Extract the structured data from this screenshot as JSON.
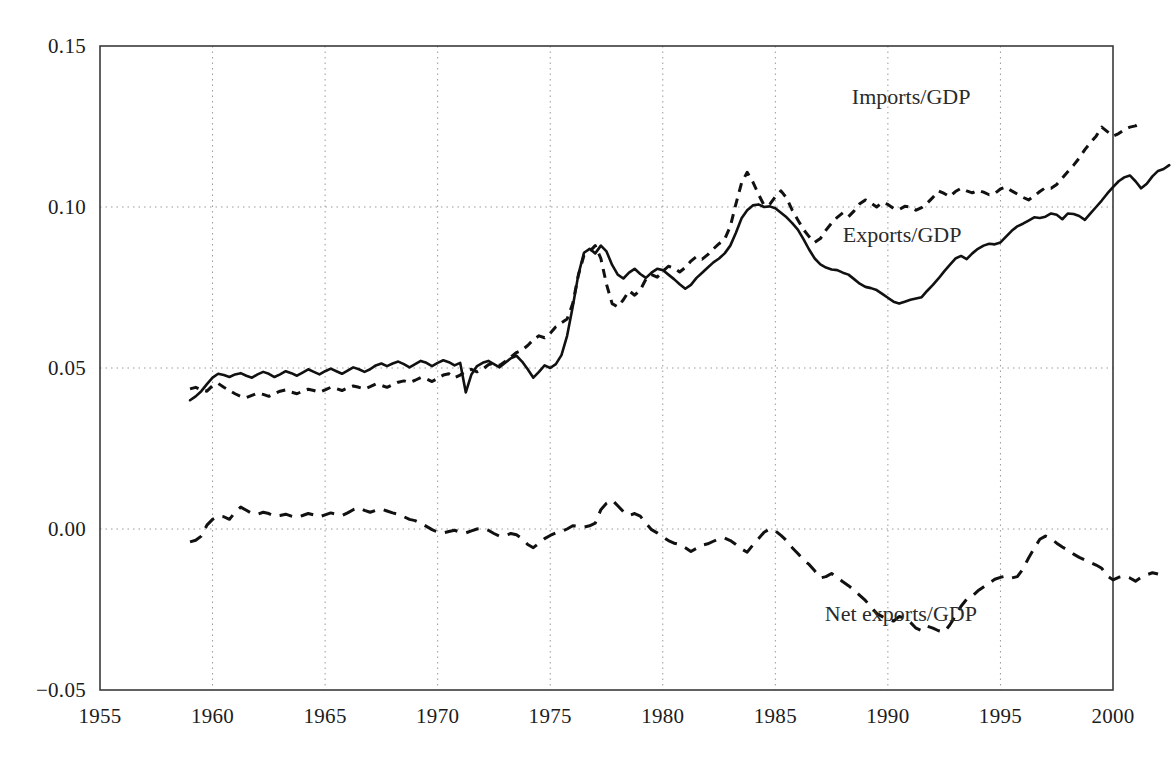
{
  "chart_data": {
    "type": "line",
    "title": "",
    "subtitle": "",
    "xlabel": "",
    "ylabel": "",
    "xlim": [
      1955,
      2000
    ],
    "ylim": [
      -0.05,
      0.15
    ],
    "grid": true,
    "grid_style": "dotted",
    "legend_position": "inline-annotations",
    "x_ticks": [
      "1955",
      "1960",
      "1965",
      "1970",
      "1975",
      "1980",
      "1985",
      "1990",
      "1995",
      "2000"
    ],
    "x_tick_values": [
      1955,
      1960,
      1965,
      1970,
      1975,
      1980,
      1985,
      1990,
      1995,
      2000
    ],
    "y_ticks": [
      "-0.05",
      "0.00",
      "0.05",
      "0.10",
      "0.15"
    ],
    "y_tick_values": [
      -0.05,
      0.0,
      0.05,
      0.1,
      0.15
    ],
    "x_start": 1959.0,
    "x_end": 1996.75,
    "x_step": 0.25,
    "series": [
      {
        "name": "Imports/GDP",
        "style": "dotted",
        "color": "#111111",
        "label_x": 1988.4,
        "label_y": 0.134,
        "values": [
          0.0435,
          0.044,
          0.0432,
          0.0428,
          0.0445,
          0.0452,
          0.044,
          0.043,
          0.042,
          0.0412,
          0.0408,
          0.0415,
          0.0422,
          0.0418,
          0.0412,
          0.042,
          0.0428,
          0.0432,
          0.0425,
          0.042,
          0.0428,
          0.0434,
          0.043,
          0.0425,
          0.0432,
          0.044,
          0.0436,
          0.043,
          0.0438,
          0.0444,
          0.044,
          0.0435,
          0.0442,
          0.045,
          0.0446,
          0.044,
          0.0448,
          0.0456,
          0.046,
          0.0455,
          0.0462,
          0.047,
          0.0466,
          0.0458,
          0.0468,
          0.0478,
          0.0482,
          0.047,
          0.0478,
          0.049,
          0.0496,
          0.0488,
          0.0496,
          0.051,
          0.0516,
          0.0508,
          0.052,
          0.0534,
          0.0548,
          0.0556,
          0.057,
          0.0588,
          0.06,
          0.0594,
          0.0608,
          0.0628,
          0.064,
          0.0652,
          0.07,
          0.0788,
          0.085,
          0.0862,
          0.088,
          0.084,
          0.076,
          0.07,
          0.069,
          0.0712,
          0.074,
          0.0726,
          0.0742,
          0.0776,
          0.079,
          0.0782,
          0.08,
          0.0816,
          0.081,
          0.0798,
          0.0812,
          0.0832,
          0.0846,
          0.0838,
          0.0852,
          0.087,
          0.0886,
          0.09,
          0.094,
          0.101,
          0.1075,
          0.1108,
          0.1078,
          0.104,
          0.1005,
          0.1008,
          0.1032,
          0.105,
          0.1028,
          0.099,
          0.096,
          0.093,
          0.0908,
          0.089,
          0.0902,
          0.0928,
          0.095,
          0.0968,
          0.0982,
          0.097,
          0.0988,
          0.101,
          0.1022,
          0.1012,
          0.1,
          0.1014,
          0.1008,
          0.0996,
          0.0992,
          0.1002,
          0.1,
          0.099,
          0.0998,
          0.1012,
          0.103,
          0.105,
          0.1042,
          0.1032,
          0.1048,
          0.1058,
          0.105,
          0.1044,
          0.1052,
          0.1046,
          0.1038,
          0.1042,
          0.1056,
          0.1062,
          0.105,
          0.104,
          0.103,
          0.1022,
          0.1034,
          0.1048,
          0.106,
          0.1058,
          0.107,
          0.109,
          0.111,
          0.113,
          0.1152,
          0.1178,
          0.12,
          0.122,
          0.1248,
          0.1234,
          0.122,
          0.1228,
          0.124,
          0.1248,
          0.1252,
          0.1262
        ]
      },
      {
        "name": "Exports/GDP",
        "style": "solid",
        "color": "#111111",
        "label_x": 1988.0,
        "label_y": 0.091,
        "values": [
          0.04,
          0.0412,
          0.0428,
          0.045,
          0.047,
          0.0482,
          0.0478,
          0.0472,
          0.048,
          0.0484,
          0.0476,
          0.047,
          0.048,
          0.0488,
          0.0482,
          0.0472,
          0.048,
          0.049,
          0.0484,
          0.0476,
          0.0486,
          0.0496,
          0.0488,
          0.048,
          0.049,
          0.0498,
          0.049,
          0.0482,
          0.0492,
          0.0502,
          0.0496,
          0.0488,
          0.0496,
          0.0508,
          0.0514,
          0.0506,
          0.0514,
          0.052,
          0.0512,
          0.0502,
          0.0512,
          0.0522,
          0.0516,
          0.0506,
          0.0516,
          0.0524,
          0.0518,
          0.0508,
          0.0516,
          0.0424,
          0.048,
          0.0506,
          0.0516,
          0.0522,
          0.0512,
          0.0502,
          0.0516,
          0.053,
          0.0538,
          0.052,
          0.0496,
          0.047,
          0.0488,
          0.0508,
          0.05,
          0.0512,
          0.054,
          0.06,
          0.069,
          0.079,
          0.0858,
          0.087,
          0.0856,
          0.088,
          0.0862,
          0.082,
          0.079,
          0.0778,
          0.0796,
          0.0808,
          0.0792,
          0.078,
          0.0796,
          0.0808,
          0.0804,
          0.079,
          0.0776,
          0.076,
          0.0746,
          0.0758,
          0.078,
          0.0796,
          0.0812,
          0.0828,
          0.084,
          0.0856,
          0.088,
          0.092,
          0.0965,
          0.099,
          0.1005,
          0.1008,
          0.1,
          0.1002,
          0.0996,
          0.0982,
          0.0968,
          0.095,
          0.093,
          0.09,
          0.0868,
          0.084,
          0.0822,
          0.0812,
          0.0806,
          0.0804,
          0.0796,
          0.079,
          0.0776,
          0.0762,
          0.0752,
          0.0748,
          0.0742,
          0.073,
          0.0718,
          0.0706,
          0.07,
          0.0706,
          0.0712,
          0.0716,
          0.072,
          0.074,
          0.0758,
          0.0778,
          0.08,
          0.082,
          0.084,
          0.0848,
          0.0838,
          0.0856,
          0.087,
          0.088,
          0.0886,
          0.0884,
          0.089,
          0.0908,
          0.0926,
          0.094,
          0.0948,
          0.0958,
          0.0968,
          0.0966,
          0.097,
          0.098,
          0.0976,
          0.0962,
          0.098,
          0.0978,
          0.0972,
          0.096,
          0.098,
          0.1,
          0.102,
          0.1042,
          0.1062,
          0.108,
          0.1092,
          0.1098,
          0.108,
          0.1058,
          0.1072,
          0.1095,
          0.1112,
          0.1118,
          0.113
        ]
      },
      {
        "name": "Net exports/GDP",
        "style": "dashed",
        "color": "#111111",
        "label_x": 1987.2,
        "label_y": -0.0268,
        "values": [
          -0.004,
          -0.0035,
          -0.0022,
          0.0012,
          0.003,
          0.004,
          0.0038,
          0.003,
          0.0052,
          0.0068,
          0.0058,
          0.0048,
          0.0046,
          0.0052,
          0.0048,
          0.004,
          0.0042,
          0.0046,
          0.004,
          0.0036,
          0.0042,
          0.0048,
          0.0044,
          0.0038,
          0.0044,
          0.005,
          0.0046,
          0.0042,
          0.005,
          0.006,
          0.0066,
          0.0058,
          0.0052,
          0.0058,
          0.0062,
          0.0056,
          0.005,
          0.0046,
          0.0038,
          0.003,
          0.0026,
          0.0018,
          0.0008,
          -0.0002,
          -0.001,
          -0.0012,
          -0.0008,
          -0.0004,
          -0.001,
          -0.0012,
          -0.0006,
          0.0,
          0.0002,
          -0.0004,
          -0.0014,
          -0.0022,
          -0.002,
          -0.0014,
          -0.0018,
          -0.003,
          -0.0048,
          -0.0058,
          -0.0044,
          -0.003,
          -0.002,
          -0.0012,
          -0.0008,
          0.0,
          0.001,
          0.0008,
          0.0006,
          0.001,
          0.0018,
          0.006,
          0.008,
          0.009,
          0.0072,
          0.0054,
          0.0042,
          0.0048,
          0.004,
          0.0018,
          -0.0002,
          -0.0012,
          -0.0024,
          -0.0036,
          -0.0044,
          -0.0048,
          -0.0058,
          -0.007,
          -0.006,
          -0.005,
          -0.0046,
          -0.0038,
          -0.003,
          -0.0028,
          -0.0036,
          -0.0048,
          -0.0062,
          -0.0072,
          -0.005,
          -0.003,
          -0.001,
          0.0,
          -0.0006,
          -0.002,
          -0.0036,
          -0.0058,
          -0.0076,
          -0.0096,
          -0.011,
          -0.013,
          -0.0152,
          -0.0148,
          -0.0138,
          -0.015,
          -0.0164,
          -0.0176,
          -0.019,
          -0.0206,
          -0.0222,
          -0.0242,
          -0.0262,
          -0.0272,
          -0.028,
          -0.0286,
          -0.0272,
          -0.0276,
          -0.029,
          -0.0308,
          -0.0316,
          -0.0302,
          -0.0308,
          -0.0316,
          -0.032,
          -0.0298,
          -0.027,
          -0.024,
          -0.0218,
          -0.0208,
          -0.0192,
          -0.018,
          -0.0168,
          -0.0156,
          -0.015,
          -0.0146,
          -0.0152,
          -0.0148,
          -0.0124,
          -0.009,
          -0.006,
          -0.0032,
          -0.0022,
          -0.003,
          -0.0044,
          -0.0056,
          -0.0066,
          -0.0078,
          -0.0088,
          -0.0096,
          -0.0104,
          -0.0112,
          -0.0122,
          -0.0146,
          -0.0158,
          -0.015,
          -0.0146,
          -0.0152,
          -0.0162,
          -0.015,
          -0.0142,
          -0.0136,
          -0.014
        ]
      }
    ]
  },
  "axes": {
    "frame_color": "#3a3a3a",
    "grid_color": "#9a9a9a"
  }
}
